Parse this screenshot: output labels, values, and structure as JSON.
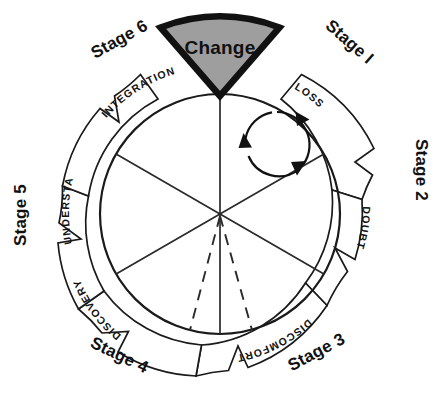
{
  "diagram": {
    "center_label": "Change",
    "colors": {
      "wedge_fill": "#9e9e9e",
      "wedge_stroke": "#111111",
      "line": "#1a1a1a",
      "text": "#111111",
      "background": "#ffffff"
    },
    "geometry": {
      "center_x": 220,
      "center_y": 214,
      "outer_radius": 163,
      "ring_inner_radius": 134,
      "inner_circle_radius": 120
    },
    "stages": [
      {
        "stage": "Stage I",
        "phase": "LOSS",
        "angle_deg": 30,
        "x": 346,
        "y": 46,
        "rotation": 41
      },
      {
        "stage": "Stage 2",
        "phase": "DOUBT",
        "angle_deg": 90,
        "x": 416,
        "y": 170,
        "rotation": 90
      },
      {
        "stage": "Stage 3",
        "phase": "DISCOMFORT",
        "angle_deg": 150,
        "x": 319,
        "y": 357,
        "rotation": -28
      },
      {
        "stage": "Stage 4",
        "phase": "DISCOVERY",
        "angle_deg": 210,
        "x": 117,
        "y": 360,
        "rotation": 26
      },
      {
        "stage": "Stage 5",
        "phase": "UNDERSTANDING",
        "angle_deg": 270,
        "x": 26,
        "y": 215,
        "rotation": -90
      },
      {
        "stage": "Stage 6",
        "phase": "INTEGRATION",
        "angle_deg": 330,
        "x": 122,
        "y": 44,
        "rotation": -29
      }
    ],
    "cyclical_arrow": {
      "name": "cyclical-motion-arrow",
      "center_x": 277,
      "center_y": 145,
      "radius": 33,
      "arrowhead_count": 3
    }
  }
}
